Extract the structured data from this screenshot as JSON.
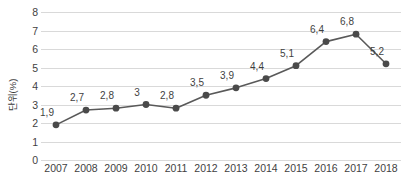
{
  "chart_data": {
    "type": "line",
    "title": "",
    "subtitle": "",
    "xlabel": "",
    "ylabel": "단위(%)",
    "categories": [
      "2007",
      "2008",
      "2009",
      "2010",
      "2011",
      "2012",
      "2013",
      "2014",
      "2015",
      "2016",
      "2017",
      "2018"
    ],
    "values": [
      1.9,
      2.7,
      2.8,
      3,
      2.8,
      3.5,
      3.9,
      4.4,
      5.1,
      6.4,
      6.8,
      5.2
    ],
    "data_labels": [
      "1,9",
      "2,7",
      "2,8",
      "3",
      "2,8",
      "3,5",
      "3,9",
      "4,4",
      "5,1",
      "6,4",
      "6,8",
      "5,2"
    ],
    "series": [
      {
        "name": "",
        "values": [
          1.9,
          2.7,
          2.8,
          3,
          2.8,
          3.5,
          3.9,
          4.4,
          5.1,
          6.4,
          6.8,
          5.2
        ]
      }
    ],
    "ylim": [
      0,
      8
    ],
    "y_ticks": [
      "0",
      "1",
      "2",
      "3",
      "4",
      "5",
      "6",
      "7",
      "8"
    ],
    "y_tick_values": [
      0,
      1,
      2,
      3,
      4,
      5,
      6,
      7,
      8
    ],
    "grid": true,
    "grid_axis": "y",
    "legend": false,
    "legend_position": "none",
    "marker": "circle",
    "colors": {
      "line": "#595959",
      "marker": "#4a4a4a",
      "grid": "#d9d9d9",
      "text": "#3f3f3f",
      "background": "#ffffff"
    }
  }
}
